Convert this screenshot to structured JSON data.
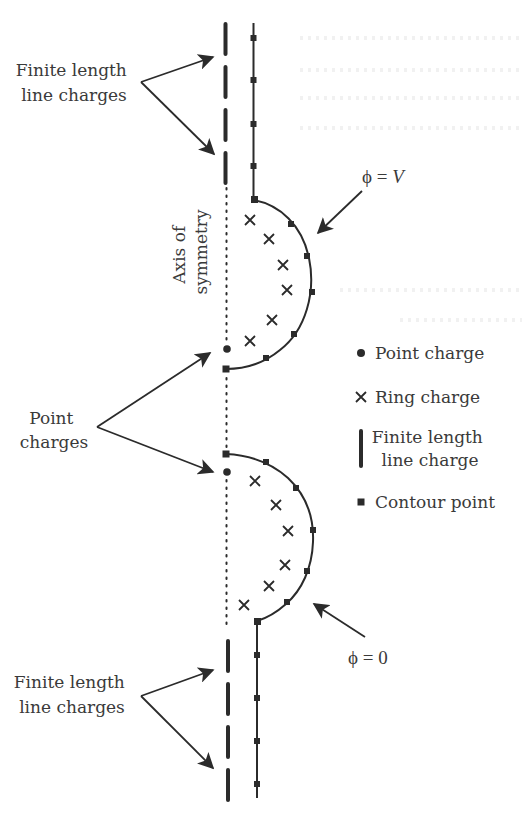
{
  "figure": {
    "labels": {
      "top_line_charges": [
        "Finite length",
        "line charges"
      ],
      "bottom_line_charges": [
        "Finite length",
        "line charges"
      ],
      "axis": [
        "Axis of",
        "symmetry"
      ],
      "point_charges": [
        "Point",
        "charges"
      ],
      "phi_top": {
        "symbol": "ϕ",
        "eq": " = ",
        "value": "V"
      },
      "phi_bottom": {
        "symbol": "ϕ",
        "eq": " = ",
        "value": "0"
      }
    },
    "legend": {
      "items": [
        {
          "icon": "point-charge-dot-icon",
          "label": "Point charge"
        },
        {
          "icon": "ring-charge-cross-icon",
          "label": "Ring charge"
        },
        {
          "icon": "line-charge-bar-icon",
          "label_lines": [
            "Finite length",
            "line charge"
          ]
        },
        {
          "icon": "contour-point-square-icon",
          "label": "Contour point"
        }
      ]
    },
    "colors": {
      "ink": "#2b2b2b",
      "text": "#3a3a3a",
      "background": "#ffffff"
    }
  }
}
